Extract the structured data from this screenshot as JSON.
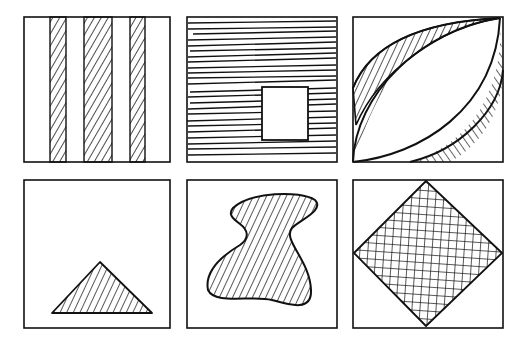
{
  "figure": {
    "layout": {
      "rows": 2,
      "cols": 3
    },
    "ink_color": "#111111",
    "background": "#ffffff",
    "panels": [
      {
        "id": "p1",
        "row": 1,
        "col": 1,
        "label": "Three vertical hatched stripes",
        "shape": "vertical-stripes",
        "fill": "diagonal-hatch",
        "stripe_count": 3
      },
      {
        "id": "p2",
        "row": 1,
        "col": 2,
        "label": "Horizontal lines with blank square",
        "shape": "square-cutout",
        "fill": "horizontal-lines"
      },
      {
        "id": "p3",
        "row": 1,
        "col": 3,
        "label": "Lens shape with hatched crescents",
        "shape": "lens",
        "fill": "diagonal-hatch-crescents"
      },
      {
        "id": "p4",
        "row": 2,
        "col": 1,
        "label": "Hatched triangle",
        "shape": "triangle",
        "fill": "diagonal-hatch"
      },
      {
        "id": "p5",
        "row": 2,
        "col": 2,
        "label": "Hatched irregular blob",
        "shape": "blob",
        "fill": "diagonal-hatch"
      },
      {
        "id": "p6",
        "row": 2,
        "col": 3,
        "label": "Cross-hatched diamond",
        "shape": "diamond",
        "fill": "cross-hatch"
      }
    ]
  }
}
